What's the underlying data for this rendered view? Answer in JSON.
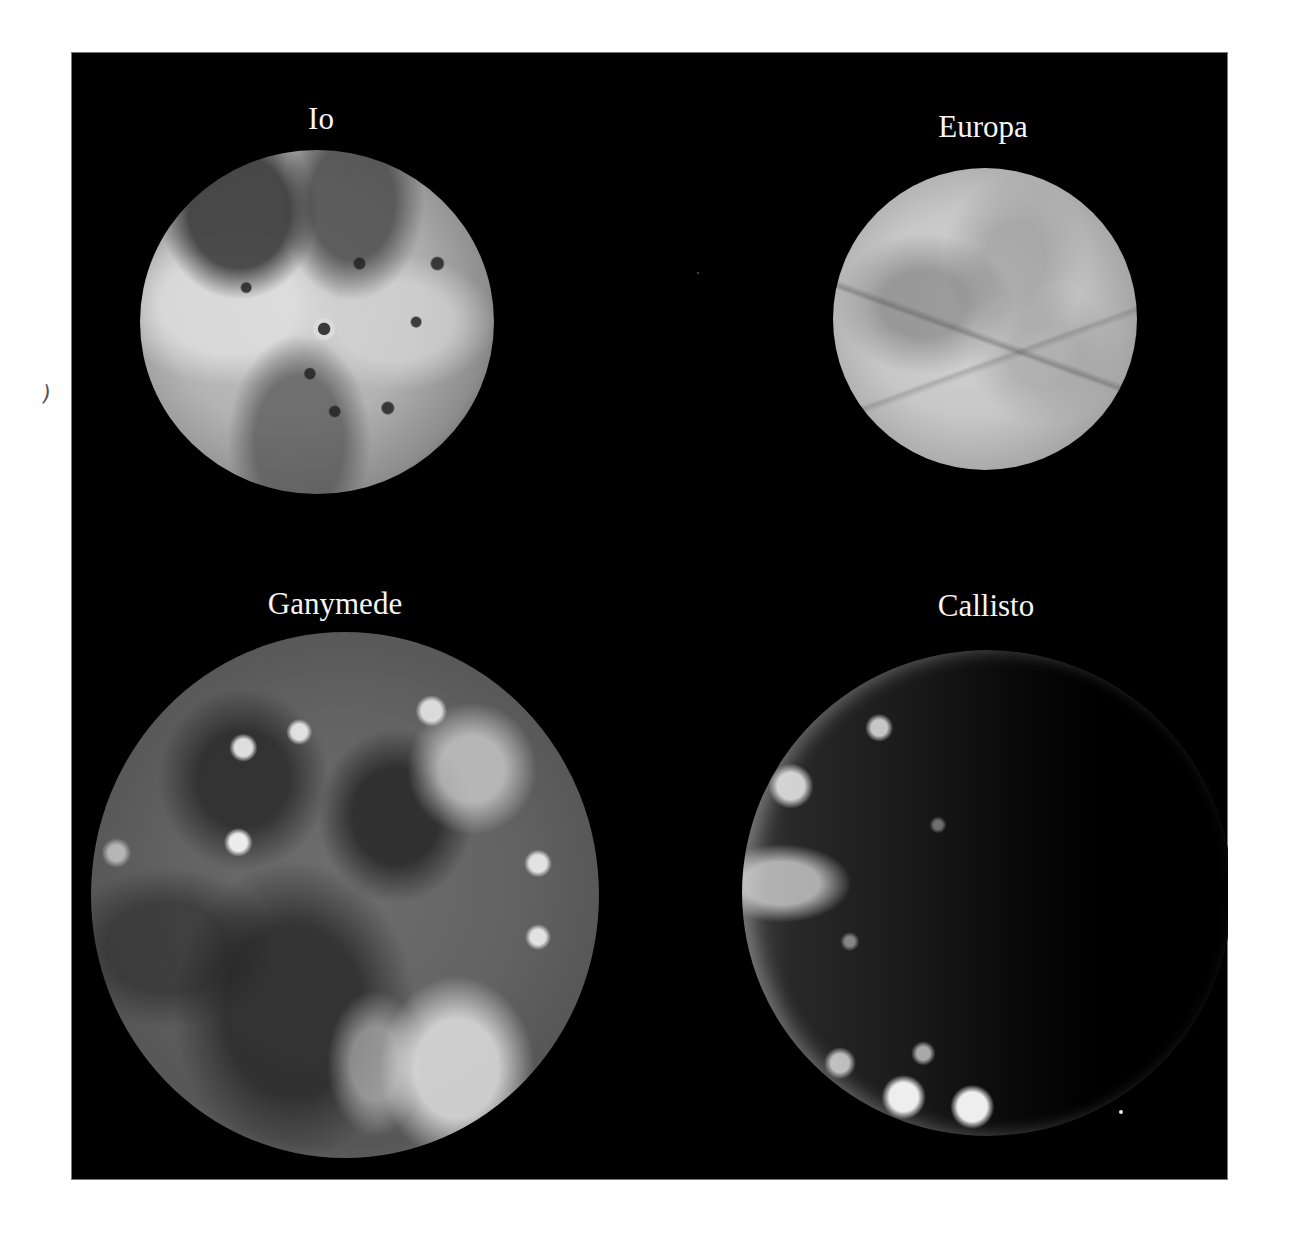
{
  "figure": {
    "background_color": "#000000",
    "page_color": "#ffffff",
    "label_color": "#f5f5f5",
    "moons": [
      {
        "name": "Io",
        "position": "top-left"
      },
      {
        "name": "Europa",
        "position": "top-right"
      },
      {
        "name": "Ganymede",
        "position": "bottom-left"
      },
      {
        "name": "Callisto",
        "position": "bottom-right"
      }
    ]
  },
  "margin": {
    "mark": ")"
  }
}
